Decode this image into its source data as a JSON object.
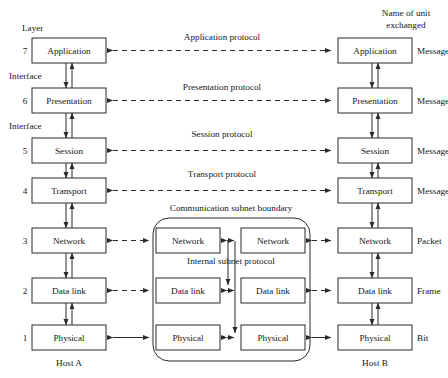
{
  "figure": {
    "title_left": "Layer",
    "title_right_line1": "Name of unit",
    "title_right_line2": "exchanged",
    "host_left": "Host A",
    "host_right": "Host B",
    "subnet_boundary_label": "Communication subnet boundary",
    "internal_protocol_label": "Internal subnet protocol",
    "interface_label": "Interface",
    "colors": {
      "background": "#ffffff",
      "stroke": "#2b2b2b",
      "text": "#161616",
      "box_fill": "#ffffff"
    }
  },
  "layers": [
    {
      "number": "7",
      "name": "Application",
      "protocol": "Application protocol",
      "unit": "Message",
      "protocol_style": "dashed",
      "interface_below": "Interface",
      "in_subnet": false
    },
    {
      "number": "6",
      "name": "Presentation",
      "protocol": "Presentation protocol",
      "unit": "Message",
      "protocol_style": "dashed",
      "interface_below": "Interface",
      "in_subnet": false
    },
    {
      "number": "5",
      "name": "Session",
      "protocol": "Session protocol",
      "unit": "Message",
      "protocol_style": "dashed",
      "interface_below": "",
      "in_subnet": false
    },
    {
      "number": "4",
      "name": "Transport",
      "protocol": "Transport protocol",
      "unit": "Message",
      "protocol_style": "dashed",
      "interface_below": "",
      "in_subnet": false
    },
    {
      "number": "3",
      "name": "Network",
      "protocol": "",
      "unit": "Packet",
      "protocol_style": "dashed",
      "interface_below": "",
      "in_subnet": true,
      "subnet_left_name": "Network",
      "subnet_right_name": "Network"
    },
    {
      "number": "2",
      "name": "Data link",
      "protocol": "",
      "unit": "Frame",
      "protocol_style": "dashed",
      "interface_below": "",
      "in_subnet": true,
      "subnet_left_name": "Data link",
      "subnet_right_name": "Data link"
    },
    {
      "number": "1",
      "name": "Physical",
      "protocol": "",
      "unit": "Bit",
      "protocol_style": "solid",
      "interface_below": "",
      "in_subnet": true,
      "subnet_left_name": "Physical",
      "subnet_right_name": "Physical"
    }
  ]
}
